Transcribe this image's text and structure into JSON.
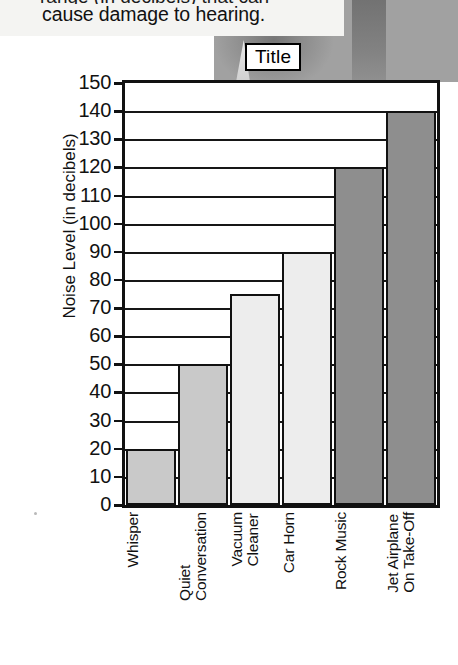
{
  "page": {
    "caption_clipped_text": "range (in decibels) that can",
    "caption_text": "cause damage to hearing."
  },
  "title_box": {
    "label": "Title"
  },
  "chart_data": {
    "type": "bar",
    "title": "Title",
    "xlabel": "",
    "ylabel": "Noise Level (in decibels)",
    "categories": [
      "Whisper",
      "Quiet\nConversation",
      "Vacuum\nCleaner",
      "Car Horn",
      "Rock Music",
      "Jet Airplane\nOn Take-Off"
    ],
    "values": [
      20,
      50,
      75,
      90,
      120,
      140
    ],
    "ylim": [
      0,
      150
    ],
    "ytick_step": 10,
    "yticks": [
      0,
      10,
      20,
      30,
      40,
      50,
      60,
      70,
      80,
      90,
      100,
      110,
      120,
      130,
      140,
      150
    ],
    "ytick_labels": [
      "0",
      "10",
      "20",
      "30",
      "40",
      "50",
      "60",
      "70",
      "80",
      "90",
      "100",
      "110",
      "120",
      "130",
      "140",
      "150"
    ],
    "grid": true,
    "legend": false,
    "bar_colors": [
      "#c9c9c9",
      "#c9c9c9",
      "#ededed",
      "#ededed",
      "#8e8e8e",
      "#8e8e8e"
    ],
    "bar_edge_color": "#111111",
    "axis_color": "#111111",
    "background": "#ffffff"
  }
}
